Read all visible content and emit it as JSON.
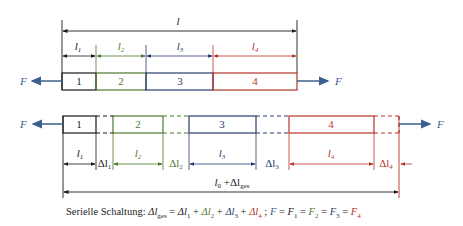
{
  "colors": {
    "black": "#1a1a1a",
    "green": "#4d7a2a",
    "blue": "#2a3a6e",
    "red": "#b8322a",
    "force": "#3a5f8f"
  },
  "top": {
    "total_length_label": "l",
    "segments": [
      {
        "number": "1",
        "length_label": "l",
        "length_sub": "1",
        "color": "black"
      },
      {
        "number": "2",
        "length_label": "l",
        "length_sub": "2",
        "color": "green"
      },
      {
        "number": "3",
        "length_label": "l",
        "length_sub": "3",
        "color": "blue"
      },
      {
        "number": "4",
        "length_label": "l",
        "length_sub": "4",
        "color": "red"
      }
    ],
    "force_left": "F",
    "force_right": "F"
  },
  "bottom": {
    "segments": [
      {
        "number": "1",
        "length_label": "l",
        "length_sub": "1",
        "delta_label": "Δl",
        "delta_sub": "1",
        "color": "black"
      },
      {
        "number": "2",
        "length_label": "l",
        "length_sub": "2",
        "delta_label": "Δl",
        "delta_sub": "2",
        "color": "green"
      },
      {
        "number": "3",
        "length_label": "l",
        "length_sub": "3",
        "delta_label": "Δl",
        "delta_sub": "3",
        "color": "blue"
      },
      {
        "number": "4",
        "length_label": "l",
        "length_sub": "4",
        "delta_label": "Δl",
        "delta_sub": "4",
        "color": "red"
      }
    ],
    "total_label_main": "l",
    "total_label_sub0": "0",
    "total_label_plus": " +Δl",
    "total_label_sub": "ges",
    "force_left": "F",
    "force_right": "F"
  },
  "formula": {
    "prefix": "Serielle  Schaltung: ",
    "delta_ges": "Δl",
    "ges_sub": "ges",
    "eq": " = ",
    "plus": " + ",
    "d": "Δl",
    "s1": "1",
    "s2": "2",
    "s3": "3",
    "s4": "4",
    "sep": " ; ",
    "F": "F",
    "Feq": " = "
  }
}
